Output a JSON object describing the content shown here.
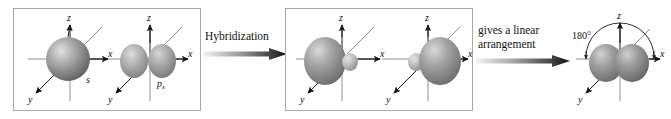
{
  "diagram": {
    "type": "orbital-hybridization",
    "colors": {
      "panel_border": "#a8a8a8",
      "axis": "#1a1a1a",
      "orbital_dark": "#6f6f6f",
      "orbital_mid": "#9a9a9a",
      "orbital_light": "#d8d8d8",
      "text": "#111111",
      "arrow_start": "#f2f2f2",
      "arrow_end": "#101010"
    },
    "axes": {
      "z_label": "z",
      "x_label": "x",
      "y_label": "y"
    }
  },
  "panels": [
    {
      "id": "panel-1",
      "orbitals": [
        {
          "id": "orb-s",
          "label": "s",
          "shape": "sphere"
        },
        {
          "id": "orb-px",
          "label": "p",
          "sublabel": "x",
          "shape": "two-lobe"
        }
      ]
    },
    {
      "id": "panel-2",
      "orbitals": [
        {
          "id": "orb-sp1",
          "label": "",
          "shape": "hybrid-left"
        },
        {
          "id": "orb-sp2",
          "label": "",
          "shape": "hybrid-right"
        }
      ]
    }
  ],
  "arrows": [
    {
      "id": "arrow-1",
      "label": "Hybridization",
      "direction": "right"
    },
    {
      "id": "arrow-2",
      "label": "gives a linear\narrangement",
      "direction": "right"
    }
  ],
  "final": {
    "id": "orb-final",
    "shape": "two-lobe-linear",
    "angle_label": "180°"
  }
}
